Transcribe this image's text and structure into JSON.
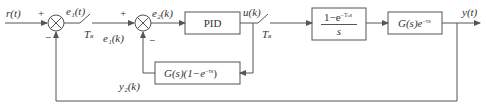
{
  "diagram": {
    "type": "control-block-diagram",
    "colors": {
      "line": "#555555",
      "text": "#333333",
      "background": "#ffffff"
    },
    "signals": {
      "input": "r(t)",
      "error1_cont": "e₁(t)",
      "error1_disc": "e₁(k)",
      "error2": "e₂(k)",
      "control": "u(k)",
      "output": "y(t)",
      "smith_feedback": "y₂(k)"
    },
    "samplers": [
      {
        "id": "sampler-1",
        "label": "Tₛ"
      },
      {
        "id": "sampler-2",
        "label": "Tₛ"
      }
    ],
    "summing_junctions": [
      {
        "id": "sum-1",
        "signs": {
          "left": "+",
          "bottom": "−"
        }
      },
      {
        "id": "sum-2",
        "signs": {
          "left": "+",
          "bottom": "−"
        }
      }
    ],
    "blocks": {
      "pid": {
        "label": "PID"
      },
      "zoh": {
        "numerator_main": "1−e",
        "numerator_sup": "−Tₛs",
        "denominator": "s"
      },
      "plant": {
        "main": "G(s)e",
        "sup": "−τs"
      },
      "smith": {
        "main": "G(s)(1−e",
        "sup": "−τs",
        "tail": ")"
      }
    }
  }
}
